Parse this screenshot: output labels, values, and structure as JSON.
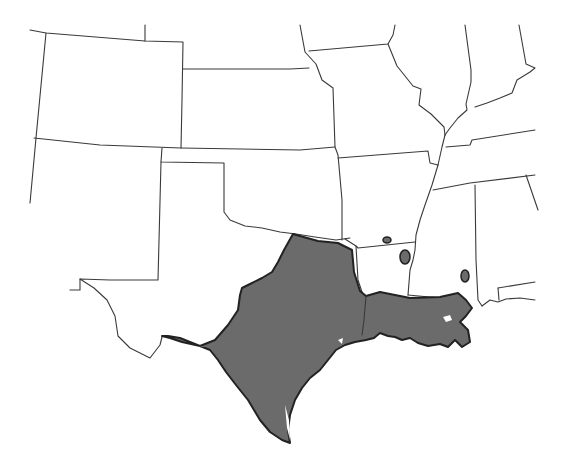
{
  "map": {
    "type": "species range map",
    "region": "South-central United States",
    "colors": {
      "background": "#ffffff",
      "state_border": "#3a3a3a",
      "range_fill": "#6b6b6b",
      "range_outline": "#222222"
    },
    "range_description": "Shaded distribution covering central and eastern Texas and southern Louisiana, plus isolated disjunct populations in southern Arkansas, northern Louisiana and southwestern Alabama",
    "disjunct_populations": 3
  }
}
